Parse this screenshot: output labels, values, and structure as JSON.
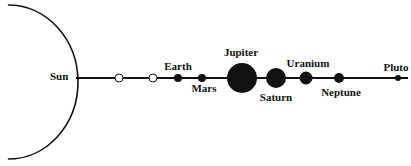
{
  "colors": {
    "ink": "#111111",
    "background": "#ffffff"
  },
  "diagram": {
    "description_type": "solar-system-line-diagram",
    "sun": {
      "label": "Sun",
      "appearance": "large-arc-segment"
    },
    "orbit_line": {
      "appearance": "horizontal-line"
    },
    "bodies": [
      {
        "label": "",
        "appearance": "open-circle",
        "relative_size": "small",
        "label_position": "none"
      },
      {
        "label": "",
        "appearance": "open-circle",
        "relative_size": "small",
        "label_position": "none"
      },
      {
        "label": "Earth",
        "appearance": "filled-circle",
        "relative_size": "small",
        "label_position": "above"
      },
      {
        "label": "Mars",
        "appearance": "filled-circle",
        "relative_size": "small",
        "label_position": "below"
      },
      {
        "label": "Jupiter",
        "appearance": "filled-circle",
        "relative_size": "largest",
        "label_position": "above"
      },
      {
        "label": "Saturn",
        "appearance": "filled-circle",
        "relative_size": "large",
        "label_position": "below"
      },
      {
        "label": "Uranium",
        "appearance": "filled-circle",
        "relative_size": "medium",
        "label_position": "above"
      },
      {
        "label": "Neptune",
        "appearance": "filled-circle",
        "relative_size": "medium-small",
        "label_position": "below"
      },
      {
        "label": "Pluto",
        "appearance": "filled-circle",
        "relative_size": "smallest",
        "label_position": "above"
      }
    ]
  }
}
